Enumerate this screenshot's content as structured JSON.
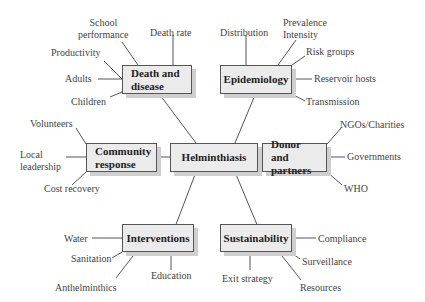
{
  "center": {
    "label": "Helminthiasis"
  },
  "nodes": {
    "death": {
      "label_line1": "Death and",
      "label_line2": "disease",
      "branches": [
        "School",
        "performance",
        "Death rate",
        "Productivity",
        "Adults",
        "Children"
      ]
    },
    "epi": {
      "label": "Epidemiology",
      "branches": [
        "Distribution",
        "Prevalence",
        "Intensity",
        "Risk groups",
        "Reservoir hosts",
        "Transmission"
      ]
    },
    "community": {
      "label_line1": "Community",
      "label_line2": "response",
      "branches": [
        "Volunteers",
        "Local",
        "leadership",
        "Cost recovery"
      ]
    },
    "donor": {
      "label_line1": "Donor and",
      "label_line2": "partners",
      "branches": [
        "NGOs/Charities",
        "Governments",
        "WHO"
      ]
    },
    "interventions": {
      "label": "Interventions",
      "branches": [
        "Water",
        "Sanitation",
        "Anthelminthics",
        "Education"
      ]
    },
    "sustainability": {
      "label": "Sustainability",
      "branches": [
        "Compliance",
        "Surveillance",
        "Exit strategy",
        "Resources"
      ]
    }
  }
}
